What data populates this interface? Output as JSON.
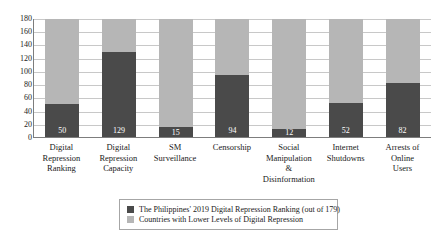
{
  "chart_data": {
    "type": "bar",
    "subtype": "stacked-bar",
    "title": "",
    "subtitle": "",
    "xlabel": "",
    "ylabel": "",
    "ylim": [
      0,
      180
    ],
    "y_ticks": [
      180,
      160,
      140,
      120,
      100,
      80,
      60,
      40,
      20,
      0
    ],
    "grid": true,
    "legend_position": "bottom",
    "categories": [
      "Digital Repression Ranking",
      "Digital Repression Capacity",
      "SM Surveillance",
      "Censorship",
      "Social Manipulation & Disinformation",
      "Internet Shutdowns",
      "Arrests of Online Users"
    ],
    "category_lines": [
      [
        "Digital",
        "Repression",
        "Ranking"
      ],
      [
        "Digital",
        "Repression",
        "Capacity"
      ],
      [
        "SM",
        "Surveillance"
      ],
      [
        "Censorship"
      ],
      [
        "Social",
        "Manipulation",
        "&",
        "Disinformation"
      ],
      [
        "Internet",
        "Shutdowns"
      ],
      [
        "Arrests of",
        "Online",
        "Users"
      ]
    ],
    "series": [
      {
        "name": "The Philippines' 2019 Digital Repression Ranking (out of 179)",
        "color": "#4a4a4a",
        "values": [
          50,
          129,
          15,
          94,
          12,
          52,
          82
        ]
      },
      {
        "name": "Countries with Lower Levels of Digital Repression",
        "color": "#b6b6b6",
        "values": [
          130,
          51,
          165,
          86,
          168,
          128,
          98
        ]
      }
    ],
    "data_labels": [
      "50",
      "129",
      "15",
      "94",
      "12",
      "52",
      "82"
    ],
    "stack_total": 180
  },
  "legend": {
    "items": [
      {
        "label": "The Philippines' 2019 Digital Repression Ranking (out of 179)",
        "swatch": "dark-swatch"
      },
      {
        "label": "Countries with Lower Levels of Digital Repression",
        "swatch": "light-swatch"
      }
    ]
  },
  "colors": {
    "series_dark": "#4a4a4a",
    "series_light": "#b6b6b6",
    "gridline": "#c8c8c8",
    "axis": "#7d7d7d",
    "text": "#1a1a1a",
    "background": "#ffffff"
  }
}
